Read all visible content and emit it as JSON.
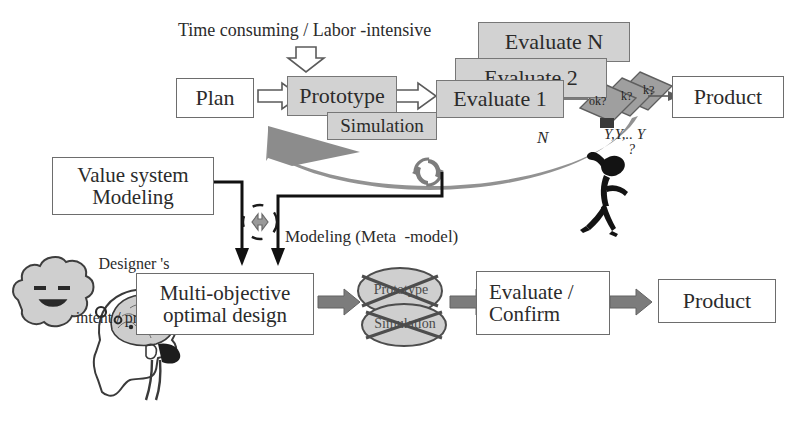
{
  "diagram": {
    "title_note": "Time consuming / Labor -intensive",
    "top_flow": {
      "plan": "Plan",
      "prototype": "Prototype",
      "simulation": "Simulation",
      "evaluate_1": "Evaluate 1",
      "evaluate_2": "Evaluate  2",
      "evaluate_n": "Evaluate N",
      "product": "Product",
      "decision_label": "ok?",
      "decision_label_2": "k?",
      "decision_label_3": "k?",
      "loop_label": "N",
      "yes_label": "Y,Y,.. Y"
    },
    "middle": {
      "value_system_line1": "Value system",
      "value_system_line2": "Modeling",
      "designer_line1": "Designer 's",
      "designer_line2": "intent / preference",
      "modeling_label": "Modeling (Meta  -model)"
    },
    "bottom_flow": {
      "multi_objective_line1": "Multi-objective",
      "multi_objective_line2": "optimal design",
      "ellipse_prototype": "Prototype",
      "ellipse_simulation": "Simulation",
      "evaluate_line1": "Evaluate /",
      "evaluate_line2": "Confirm",
      "product": "Product"
    },
    "figures": {
      "thinker_icon": "stick-figure-question",
      "question_mark": "?",
      "thought_dots": "o o .",
      "head_icon": "human-head-brain",
      "cloud_face_icon": "thought-cloud-face"
    },
    "colors": {
      "box_fill_gray": "#d2d2d2",
      "box_fill_white": "#ffffff",
      "border_gray": "#6d6d6d",
      "arrow_gray": "#808080",
      "arrow_dark": "#6a6a6a",
      "text": "#2b2b2b",
      "figure_black": "#111111"
    }
  }
}
